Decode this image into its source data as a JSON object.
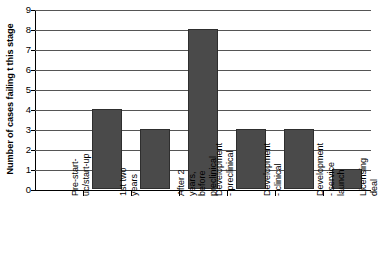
{
  "chart_data": {
    "type": "bar",
    "title": "",
    "xlabel": "",
    "ylabel": "Number of cases failing \u0001t this stage",
    "ylim": [
      0,
      9
    ],
    "y_ticks": [
      0,
      1,
      2,
      3,
      4,
      5,
      6,
      7,
      8,
      9
    ],
    "grid": true,
    "legend": "none",
    "bar_color": "#4a4a4a",
    "categories": [
      "Pre-start-uc/start-up",
      "1st two years",
      "After 2 years, before preclinical",
      "Development - preclinical",
      "Development - clinical",
      "Development - service launch",
      "Licensing deal"
    ],
    "category_lines": [
      [
        "Pre-start-",
        "uc/start-up"
      ],
      [
        "1st two",
        "years"
      ],
      [
        "After 2",
        "years,",
        "before",
        "preclinical"
      ],
      [
        "Development",
        "- preclinical"
      ],
      [
        "Development",
        "- clinical"
      ],
      [
        "Development",
        "- service",
        "launch"
      ],
      [
        "Licensing",
        "deal"
      ]
    ],
    "values": [
      0,
      4,
      3,
      8,
      3,
      3,
      1
    ]
  }
}
